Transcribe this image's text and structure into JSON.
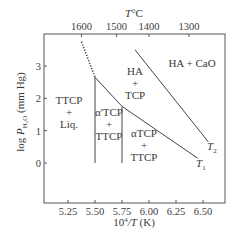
{
  "chart_data": {
    "type": "phase-diagram",
    "top_axis": {
      "label_var": "T",
      "label_unit": "°C",
      "ticks": [
        "1600",
        "1500",
        "1400",
        "1300"
      ]
    },
    "bottom_axis": {
      "label_pre": "10",
      "label_sup": "4",
      "label_var": "/T",
      "label_unit": " (K)",
      "ticks": [
        "5.25",
        "5.50",
        "5.75",
        "6.00",
        "6.25",
        "6.50"
      ],
      "tick_values": [
        5.25,
        5.5,
        5.75,
        6.0,
        6.25,
        6.5
      ]
    },
    "left_axis": {
      "label_pre": "log ",
      "label_var": "P",
      "label_sub": "H₂O",
      "label_unit": " (mm Hg)",
      "ticks": [
        "0",
        "1",
        "2",
        "3"
      ],
      "tick_values": [
        0,
        1,
        2,
        3
      ]
    },
    "top_tick_positions_inv_T": [
      5.375,
      5.7,
      6.0,
      6.37
    ],
    "boundaries": {
      "liquidus_dotted": [
        [
          5.375,
          3.75
        ],
        [
          5.5,
          2.65
        ]
      ],
      "T1": [
        [
          5.5,
          2.65
        ],
        [
          5.75,
          1.75
        ],
        [
          6.45,
          0.15
        ]
      ],
      "T2": [
        [
          5.87,
          3.5
        ],
        [
          6.55,
          0.65
        ]
      ],
      "vertical_5_50": [
        [
          5.5,
          2.65
        ],
        [
          5.5,
          0
        ]
      ],
      "vertical_5_75": [
        [
          5.75,
          1.75
        ],
        [
          5.75,
          0
        ]
      ]
    },
    "regions": [
      {
        "name": "ttcp-liq",
        "lines": [
          "TTCP",
          "+",
          "Liq."
        ]
      },
      {
        "name": "alpha-prime-tcp-ttcp",
        "lines": [
          "α'TCP",
          "+",
          "TTCP"
        ]
      },
      {
        "name": "alpha-tcp-ttcp",
        "lines": [
          "αTCP",
          "+",
          "TTCP"
        ]
      },
      {
        "name": "ha-tcp",
        "lines": [
          "HA",
          "+",
          "TCP"
        ]
      },
      {
        "name": "ha-cao",
        "lines": [
          "HA + CaO"
        ]
      }
    ],
    "curve_labels": {
      "T1": {
        "var": "T",
        "sub": "1"
      },
      "T2": {
        "var": "T",
        "sub": "2"
      }
    }
  }
}
